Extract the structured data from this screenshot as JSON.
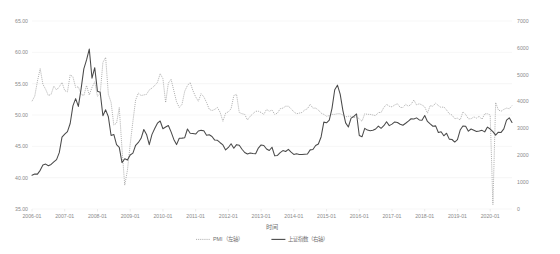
{
  "chart_data": {
    "type": "line",
    "title": "",
    "xlabel": "时间",
    "ylabel": "",
    "grid": true,
    "legend_position": "bottom",
    "left_axis": {
      "name": "PMI",
      "ylim": [
        35.0,
        65.0
      ],
      "ticks": [
        "35.00",
        "40.00",
        "45.00",
        "50.00",
        "55.00",
        "60.00",
        "65.00"
      ],
      "tick_values": [
        35,
        40,
        45,
        50,
        55,
        60,
        65
      ]
    },
    "right_axis": {
      "name": "上证指数",
      "ylim": [
        0,
        7000
      ],
      "ticks": [
        "0",
        "1000",
        "2000",
        "3000",
        "4000",
        "5000",
        "6000",
        "7000"
      ],
      "tick_values": [
        0,
        1000,
        2000,
        3000,
        4000,
        5000,
        6000,
        7000
      ]
    },
    "xticks": [
      "2006-01",
      "2007-01",
      "2008-01",
      "2009-01",
      "2010-01",
      "2011-01",
      "2012-01",
      "2013-01",
      "2014-01",
      "2015-01",
      "2016-01",
      "2017-01",
      "2018-01",
      "2019-01",
      "2020-01"
    ],
    "x_start": "2006-01",
    "x_end": "2020-09",
    "legend": [
      {
        "label": "PMI（左轴）",
        "style": "dotted",
        "color": "#9a9a9a",
        "axis": "left"
      },
      {
        "label": "上证指数（右轴）",
        "style": "solid",
        "color": "#4a4a4a",
        "axis": "right"
      }
    ],
    "series": [
      {
        "name": "PMI（左轴）",
        "axis": "left",
        "style": "dotted",
        "color": "#9a9a9a",
        "values": [
          52.2,
          53.0,
          55.4,
          57.4,
          54.9,
          54.1,
          53.1,
          53.3,
          54.6,
          54.0,
          54.5,
          55.2,
          53.9,
          53.7,
          56.4,
          56.1,
          54.4,
          54.5,
          53.3,
          53.1,
          54.7,
          53.2,
          54.4,
          55.3,
          53.0,
          53.4,
          58.4,
          59.2,
          53.3,
          52.0,
          48.4,
          48.7,
          51.2,
          44.6,
          38.8,
          41.2,
          45.3,
          49.0,
          52.4,
          53.5,
          53.1,
          53.2,
          53.3,
          54.0,
          54.3,
          54.7,
          55.2,
          56.6,
          55.8,
          52.0,
          55.1,
          55.7,
          53.9,
          52.1,
          51.2,
          51.7,
          53.8,
          54.7,
          55.2,
          53.9,
          52.9,
          52.2,
          53.4,
          52.9,
          52.0,
          50.9,
          50.7,
          50.9,
          51.2,
          50.4,
          49.0,
          50.3,
          50.5,
          51.0,
          53.1,
          53.3,
          50.4,
          50.2,
          50.1,
          49.2,
          49.8,
          50.2,
          50.6,
          50.6,
          50.4,
          50.1,
          50.9,
          50.6,
          50.8,
          50.1,
          50.3,
          51.0,
          51.1,
          51.4,
          51.4,
          51.0,
          50.5,
          50.2,
          50.3,
          50.4,
          50.8,
          51.0,
          51.7,
          51.1,
          51.1,
          50.8,
          50.3,
          50.1,
          49.8,
          49.9,
          50.1,
          50.1,
          50.2,
          50.2,
          50.0,
          49.7,
          49.8,
          49.8,
          49.6,
          49.7,
          49.4,
          49.0,
          50.2,
          50.1,
          50.1,
          50.0,
          49.9,
          50.4,
          50.4,
          51.2,
          51.7,
          51.4,
          51.3,
          51.6,
          51.8,
          51.2,
          51.2,
          51.7,
          51.4,
          51.7,
          52.4,
          51.6,
          51.8,
          51.6,
          51.3,
          50.3,
          51.5,
          51.4,
          51.9,
          51.5,
          51.2,
          51.3,
          50.8,
          50.2,
          50.0,
          49.4,
          49.5,
          49.2,
          50.5,
          50.1,
          49.4,
          49.4,
          49.7,
          49.5,
          49.8,
          49.3,
          50.2,
          50.2,
          50.0,
          35.7,
          52.0,
          50.8,
          50.6,
          50.9,
          51.1,
          51.0,
          51.5
        ]
      },
      {
        "name": "上证指数（右轴）",
        "axis": "right",
        "style": "solid",
        "color": "#4a4a4a",
        "values": [
          1258,
          1299,
          1298,
          1440,
          1641,
          1672,
          1612,
          1658,
          1752,
          1837,
          2099,
          2675,
          2786,
          2881,
          3183,
          3841,
          4110,
          3820,
          4472,
          5219,
          5552,
          5955,
          4872,
          5262,
          4383,
          4348,
          3473,
          3693,
          3433,
          2736,
          2775,
          2397,
          2294,
          1728,
          1871,
          1821,
          2011,
          2083,
          2373,
          2478,
          2633,
          2959,
          2775,
          2397,
          2779,
          2995,
          3195,
          3277,
          2989,
          3051,
          3109,
          2871,
          2592,
          2398,
          2637,
          2639,
          2655,
          2978,
          2820,
          2808,
          2790,
          2905,
          2928,
          2911,
          2743,
          2762,
          2701,
          2567,
          2556,
          2468,
          2386,
          2199,
          2292,
          2428,
          2263,
          2396,
          2372,
          2225,
          2104,
          2048,
          2086,
          2068,
          2059,
          2269,
          2385,
          2366,
          2236,
          2177,
          2300,
          1979,
          1993,
          2098,
          2174,
          2141,
          2220,
          2116,
          2033,
          2056,
          2033,
          2026,
          2039,
          2048,
          2202,
          2217,
          2364,
          2420,
          2683,
          3235,
          3211,
          3310,
          3748,
          4441,
          4611,
          4277,
          3664,
          3206,
          3053,
          3383,
          3445,
          3539,
          2738,
          2688,
          3004,
          2938,
          2916,
          2930,
          2979,
          3086,
          3005,
          3100,
          3250,
          3104,
          3159,
          3242,
          3222,
          3154,
          3117,
          3192,
          3273,
          3360,
          3349,
          3393,
          3317,
          3307,
          3480,
          3259,
          3168,
          3082,
          3095,
          2847,
          2876,
          2725,
          2821,
          2602,
          2588,
          2494,
          2584,
          2940,
          3091,
          3078,
          2898,
          2978,
          2932,
          2886,
          2905,
          2929,
          2872,
          3050,
          2977,
          2880,
          2750,
          2860,
          2852,
          2984,
          3310,
          3395,
          3218
        ]
      }
    ]
  },
  "axis_labels": {
    "x_title": "时间"
  }
}
